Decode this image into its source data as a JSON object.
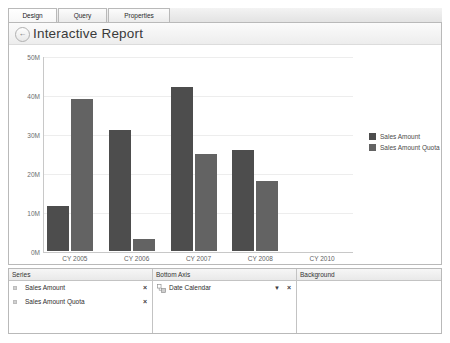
{
  "tabs": [
    {
      "label": "Design",
      "active": true
    },
    {
      "label": "Query",
      "active": false
    },
    {
      "label": "Properties",
      "active": false
    }
  ],
  "report": {
    "title": "Interactive Report",
    "back_icon": "back-arrow-icon"
  },
  "chart_data": {
    "type": "bar",
    "title": "",
    "xlabel": "",
    "ylabel": "",
    "categories": [
      "CY 2005",
      "CY 2006",
      "CY 2007",
      "CY 2008",
      "CY 2010"
    ],
    "series": [
      {
        "name": "Sales Amount",
        "color": "#4d4d4d",
        "values": [
          11.5,
          31,
          42,
          26,
          0
        ]
      },
      {
        "name": "Sales Amount Quota",
        "color": "#636363",
        "values": [
          39,
          3,
          25,
          18,
          0
        ]
      }
    ],
    "ylim": [
      0,
      50
    ],
    "yticks": [
      0,
      10,
      20,
      30,
      40,
      50
    ],
    "ytick_labels": [
      "0M",
      "10M",
      "20M",
      "30M",
      "40M",
      "50M"
    ],
    "grid": true,
    "legend_position": "right"
  },
  "panes": {
    "series": {
      "header": "Series",
      "items": [
        {
          "label": "Sales Amount",
          "remove": "×"
        },
        {
          "label": "Sales Amount Quota",
          "remove": "×"
        }
      ]
    },
    "bottom_axis": {
      "header": "Bottom Axis",
      "items": [
        {
          "label": "Date Calendar",
          "caret": "▼",
          "remove": "×"
        }
      ]
    },
    "background": {
      "header": "Background",
      "items": []
    }
  }
}
